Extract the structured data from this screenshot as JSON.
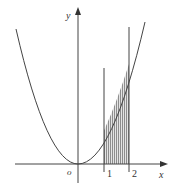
{
  "figure": {
    "axis_x_label": "x",
    "axis_y_label": "y",
    "origin_label": "o",
    "tick_labels": [
      "1",
      "2"
    ],
    "curve": "parabola y = k·x²",
    "shaded_region": "area under curve between x = 1 and x = 2"
  },
  "colors": {
    "stroke": "#444444",
    "shade": "#777777",
    "background": "#ffffff"
  }
}
